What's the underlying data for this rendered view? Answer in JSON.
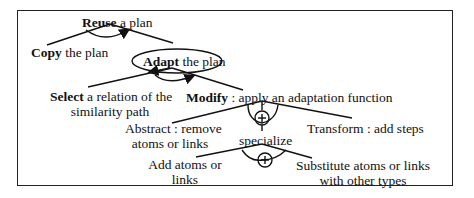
{
  "diagram": {
    "type": "plan-reuse goal decomposition",
    "nodes": {
      "reuse": {
        "bold": "Reuse",
        "rest": " a plan"
      },
      "copy": {
        "bold": "Copy",
        "rest": " the plan"
      },
      "adapt": {
        "bold": "Adapt",
        "rest": " the plan"
      },
      "select_line1": {
        "bold": "Select",
        "rest": " a relation of the"
      },
      "select_line2": "similarity path",
      "modify": {
        "bold": "Modify",
        "rest": " : apply an adaptation function"
      },
      "abstract_line1": "Abstract : remove",
      "abstract_line2": "atoms or links",
      "transform": "Transform : add steps",
      "specialize": "specialize",
      "add_line1": "Add atoms or",
      "add_line2": "links",
      "substitute_line1": "Substitute atoms or links",
      "substitute_line2": "with other types"
    },
    "connectors": {
      "or_symbol": "+"
    },
    "colors": {
      "stroke": "#111111",
      "background": "#ffffff"
    }
  }
}
